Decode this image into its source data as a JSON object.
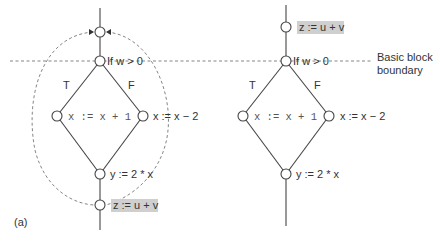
{
  "figure": {
    "panel_label": "(a)",
    "boundary_label_line1": "Basic block",
    "boundary_label_line2": "boundary"
  },
  "left_graph": {
    "branch_true": "T",
    "branch_false": "F",
    "cond": "If w > 0",
    "then_stmt": "x := x + 1",
    "else_stmt": "x := x − 2",
    "join_stmt": "y := 2 * x",
    "moved_stmt": "z := u + v"
  },
  "right_graph": {
    "branch_true": "T",
    "branch_false": "F",
    "moved_stmt": "z := u + v",
    "cond": "If w > 0",
    "then_stmt": "x := x + 1",
    "else_stmt": "x := x − 2",
    "join_stmt": "y := 2 * x"
  },
  "colors": {
    "highlight": "#cfcfcf",
    "line": "#444444",
    "dashed": "#777777"
  }
}
